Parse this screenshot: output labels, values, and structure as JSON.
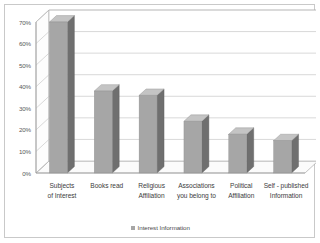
{
  "chart_data": {
    "type": "bar",
    "title": "",
    "subtitle": "",
    "xlabel": "",
    "ylabel": "",
    "categories": [
      "Subjects of Interest",
      "Books read",
      "Religious Affiliation",
      "Associations you belong to",
      "Political Affiliation",
      "Self - published Information"
    ],
    "category_lines": [
      [
        "Subjects",
        "of Interest"
      ],
      [
        "Books read",
        ""
      ],
      [
        "Religious",
        "Affiliation"
      ],
      [
        "Associations",
        "you belong to"
      ],
      [
        "Political",
        "Affiliation"
      ],
      [
        "Self - published",
        "Information"
      ]
    ],
    "series": [
      {
        "name": "Interest Information",
        "values": [
          70,
          38,
          36,
          24,
          18,
          15
        ]
      }
    ],
    "values": [
      70,
      38,
      36,
      24,
      18,
      15
    ],
    "ylim": [
      0,
      70
    ],
    "ytick_values": [
      0,
      10,
      20,
      30,
      40,
      50,
      60,
      70
    ],
    "ytick_labels": [
      "0%",
      "10%",
      "20%",
      "30%",
      "40%",
      "50%",
      "60%",
      "70%"
    ],
    "grid": true,
    "legend_position": "bottom",
    "style": "3d-column",
    "colors": {
      "bar_front": "#a6a6a6",
      "bar_side": "#6f6f6f",
      "bar_top": "#c4c4c4",
      "gridline": "#c0c0c0",
      "axis": "#9a9a9a",
      "floor": "#fbfbfb",
      "background": "#ffffff",
      "border": "#c9c9c9",
      "text": "#3d3d3d"
    }
  },
  "legend": {
    "label": "Interest Information",
    "marker": "square-marker"
  }
}
